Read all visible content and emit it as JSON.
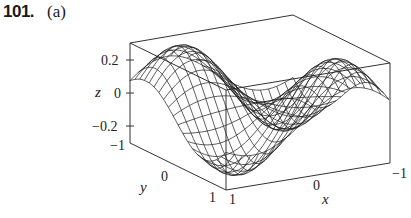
{
  "problem": {
    "number": "101.",
    "part": "(a)",
    "faint_header_text": ", y   ,"
  },
  "chart_data": {
    "type": "surface3d",
    "title": "",
    "x_axis": {
      "label": "x",
      "ticks": [
        "1",
        "0",
        "-1"
      ],
      "range": [
        -1,
        1
      ]
    },
    "y_axis": {
      "label": "y",
      "ticks": [
        "-1",
        "0",
        "1"
      ],
      "range": [
        -1,
        1
      ]
    },
    "z_axis": {
      "label": "z",
      "ticks": [
        "0.2",
        "0",
        "-0.2"
      ],
      "range": [
        -0.3,
        0.3
      ]
    },
    "box": true,
    "grid_resolution": 20,
    "colors": {
      "mesh": "#1a1a1a",
      "box": "#333333",
      "background": "#ffffff"
    }
  },
  "labels": {
    "z_ticks": [
      "0.2",
      "0",
      "−0.2"
    ],
    "z_label": "z",
    "y_ticks": [
      "−1",
      "0",
      "1"
    ],
    "y_label": "y",
    "x_ticks": [
      "1",
      "0",
      "−1"
    ],
    "x_label": "x"
  }
}
